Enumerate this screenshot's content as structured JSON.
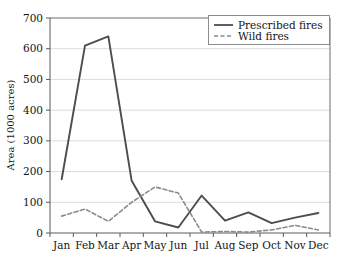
{
  "chart_data": {
    "type": "line",
    "title": "",
    "xlabel": "",
    "ylabel": "Area (1000 acres)",
    "categories": [
      "Jan",
      "Feb",
      "Mar",
      "Apr",
      "May",
      "Jun",
      "Jul",
      "Aug",
      "Sep",
      "Oct",
      "Nov",
      "Dec"
    ],
    "ylim": [
      0,
      700
    ],
    "yticks": [
      0,
      100,
      200,
      300,
      400,
      500,
      600,
      700
    ],
    "ytick_labels": [
      "0",
      "100",
      "200",
      "300",
      "400",
      "500",
      "600",
      "700"
    ],
    "grid": true,
    "grid_axis": "y",
    "legend_position": "top-right",
    "series": [
      {
        "name": "Prescribed fires",
        "style": "solid",
        "color": "#4d4d4d",
        "values": [
          175,
          610,
          640,
          170,
          38,
          18,
          122,
          40,
          67,
          32,
          50,
          65
        ]
      },
      {
        "name": "Wild fires",
        "style": "dashed",
        "color": "#8a8a8a",
        "values": [
          55,
          78,
          38,
          100,
          150,
          130,
          3,
          5,
          3,
          10,
          25,
          10
        ]
      }
    ]
  },
  "legend": {
    "entries": [
      {
        "label": "Prescribed fires"
      },
      {
        "label": "Wild fires"
      }
    ]
  },
  "axes": {
    "y_title": "Area (1000 acres)",
    "y_tick_labels": [
      "700",
      "600",
      "500",
      "400",
      "300",
      "200",
      "100",
      "0"
    ],
    "x_tick_labels": [
      "Jan",
      "Feb",
      "Mar",
      "Apr",
      "May",
      "Jun",
      "Jul",
      "Aug",
      "Sep",
      "Oct",
      "Nov",
      "Dec"
    ]
  },
  "colors": {
    "prescribed": "#4d4d4d",
    "wild": "#8a8a8a",
    "grid": "#dcdcdc",
    "axis": "#5a5a5a",
    "background": "#ffffff"
  }
}
